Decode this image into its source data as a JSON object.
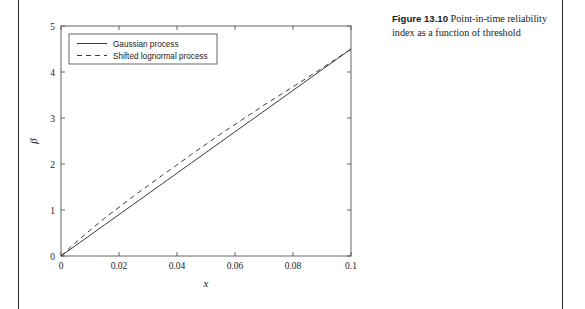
{
  "page": {
    "background": "#ffffff",
    "rule_color": "#2b2b2b"
  },
  "caption": {
    "label": "Figure 13.10",
    "text": "Point-in-time reliability index as a function of threshold"
  },
  "chart_data": {
    "type": "line",
    "title": "",
    "xlabel": "x",
    "ylabel": "β",
    "xlim": [
      0,
      0.1
    ],
    "ylim": [
      0,
      5
    ],
    "xticks": [
      0,
      0.02,
      0.04,
      0.06,
      0.08,
      0.1
    ],
    "xticklabels": [
      "0",
      "0.02",
      "0.04",
      "0.06",
      "0.08",
      "0.1"
    ],
    "yticks": [
      0,
      1,
      2,
      3,
      4,
      5
    ],
    "yticklabels": [
      "0",
      "1",
      "2",
      "3",
      "4",
      "5"
    ],
    "grid": false,
    "legend_position": "upper left",
    "line_color": "#3a3a3a",
    "x": [
      0,
      0.005,
      0.01,
      0.015,
      0.02,
      0.025,
      0.03,
      0.035,
      0.04,
      0.045,
      0.05,
      0.055,
      0.06,
      0.065,
      0.07,
      0.075,
      0.08,
      0.085,
      0.09,
      0.095,
      0.1
    ],
    "series": [
      {
        "name": "Gaussian process",
        "style": "solid",
        "values": [
          0,
          0.225,
          0.45,
          0.675,
          0.9,
          1.125,
          1.35,
          1.575,
          1.8,
          2.025,
          2.25,
          2.475,
          2.7,
          2.925,
          3.15,
          3.375,
          3.6,
          3.825,
          4.05,
          4.275,
          4.5
        ]
      },
      {
        "name": "Shifted lognormal process",
        "style": "dashed",
        "values": [
          0,
          0.29,
          0.56,
          0.82,
          1.06,
          1.3,
          1.53,
          1.76,
          1.98,
          2.21,
          2.43,
          2.65,
          2.86,
          3.07,
          3.28,
          3.48,
          3.68,
          3.88,
          4.08,
          4.29,
          4.5
        ]
      }
    ]
  }
}
